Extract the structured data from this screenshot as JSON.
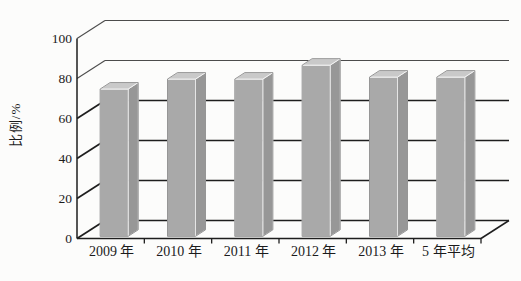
{
  "chart_data": {
    "type": "bar",
    "style": "3d-column-grayscale",
    "title": "",
    "categories": [
      "2009 年",
      "2010 年",
      "2011 年",
      "2012 年",
      "2013 年",
      "5 年平均"
    ],
    "values": [
      74,
      79,
      79,
      86,
      80,
      80
    ],
    "xlabel": "",
    "ylabel": "比例/%",
    "yticks": [
      0,
      20,
      40,
      60,
      80,
      100
    ],
    "ylim": [
      0,
      100
    ],
    "grid": "horizontal-back-wall",
    "legend": "none",
    "bar_color_front": "#a9a9a9",
    "bar_color_side": "#979797",
    "bar_color_top": "#c9c9c9",
    "line_color_dark": "#1e1e1e",
    "line_color_light": "#4c4c4c"
  }
}
